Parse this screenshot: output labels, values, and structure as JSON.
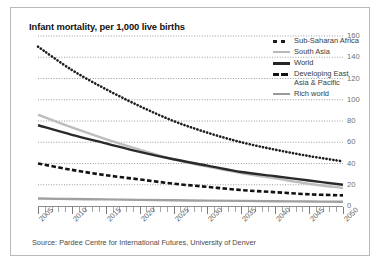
{
  "title": "Infant mortality, per 1,000 live births",
  "source": "Source: Pardee Centre for International Futures, University of Denver",
  "legend": {
    "items": [
      {
        "label": "Sub-Saharan Africa",
        "style": "square-dotted",
        "color": "#1d1d1d"
      },
      {
        "label": "South Asia",
        "style": "solid",
        "color": "#b8b8b8"
      },
      {
        "label": "World",
        "style": "solid-thick",
        "color": "#252525"
      },
      {
        "label": "Developing East\nAsia & Pacific",
        "style": "dashed",
        "color": "#141414"
      },
      {
        "label": "Rich world",
        "style": "solid",
        "color": "#9a9a9a"
      }
    ]
  },
  "chart_data": {
    "type": "line",
    "title": "Infant mortality, per 1,000 live births",
    "xlabel": "",
    "ylabel": "",
    "ylim": [
      0,
      160
    ],
    "xlim": [
      2005,
      2050
    ],
    "yticks": [
      0,
      20,
      40,
      60,
      80,
      100,
      120,
      140,
      160
    ],
    "ytick_labels": [
      "0",
      "20",
      "40",
      "60",
      "80",
      "100",
      "120",
      "140",
      "160"
    ],
    "y_axis_side": "right",
    "grid": "horizontal-dotted",
    "legend_position": "top-right",
    "xticks": [
      2005,
      2010,
      2015,
      2020,
      2025,
      2030,
      2035,
      2040,
      2045,
      2050
    ],
    "xtick_labels": [
      "2005",
      "2010",
      "2015",
      "2020",
      "2025",
      "2030",
      "2035",
      "2040",
      "2045",
      "2050"
    ],
    "x": [
      2005,
      2010,
      2015,
      2020,
      2025,
      2030,
      2035,
      2040,
      2045,
      2050
    ],
    "series": [
      {
        "name": "Sub-Saharan Africa",
        "values": [
          150,
          128,
          110,
          94,
          80,
          69,
          60,
          53,
          47,
          42
        ]
      },
      {
        "name": "South Asia",
        "values": [
          86,
          74,
          63,
          53,
          44,
          37,
          31,
          26,
          21,
          17
        ]
      },
      {
        "name": "World",
        "values": [
          76,
          67,
          59,
          51,
          44,
          38,
          32,
          28,
          24,
          20
        ]
      },
      {
        "name": "Developing East Asia & Pacific",
        "values": [
          40,
          34,
          29,
          25,
          21,
          18,
          15,
          13,
          11,
          10
        ]
      },
      {
        "name": "Rich world",
        "values": [
          7,
          6.6,
          6.2,
          5.8,
          5.4,
          5.1,
          4.8,
          4.5,
          4.2,
          4
        ]
      }
    ]
  }
}
